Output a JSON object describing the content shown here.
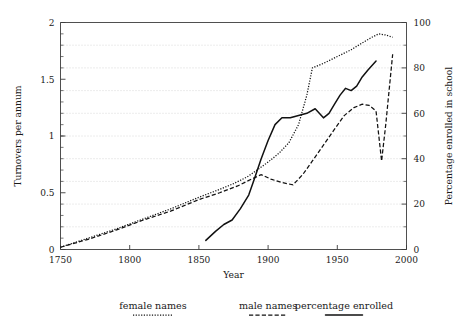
{
  "chart_data": {
    "type": "line",
    "title": "",
    "xlabel": "Year",
    "ylabel": "Turnovers per annum",
    "y2label": "Percentage enrolled in school",
    "xlim": [
      1750,
      2000
    ],
    "ylim": [
      0,
      2
    ],
    "y2lim": [
      0,
      100
    ],
    "xticks": [
      1750,
      1800,
      1850,
      1900,
      1950,
      2000
    ],
    "xticklabels": [
      "1750",
      "1800",
      "1850",
      "1900",
      "1950",
      "2000"
    ],
    "yticks": [
      0,
      0.5,
      1,
      1.5,
      2
    ],
    "yticklabels": [
      "0",
      "0.5",
      "1",
      "1.5",
      "2"
    ],
    "y2ticks": [
      0,
      20,
      40,
      60,
      80,
      100
    ],
    "y2ticklabels": [
      "0",
      "20",
      "40",
      "60",
      "80",
      "100"
    ],
    "grid": true,
    "grid_axis": "y2",
    "grid_values": [
      10,
      20,
      30,
      40,
      50,
      60,
      70,
      80,
      90
    ],
    "legend_position": "below",
    "series": [
      {
        "name": "female names",
        "axis": "left",
        "style": "dotted",
        "x": [
          1750,
          1770,
          1790,
          1810,
          1830,
          1850,
          1865,
          1875,
          1885,
          1892,
          1900,
          1908,
          1915,
          1922,
          1928,
          1932,
          1940,
          1950,
          1960,
          1968,
          1975,
          1980,
          1985,
          1990
        ],
        "values": [
          0.02,
          0.1,
          0.18,
          0.27,
          0.36,
          0.46,
          0.53,
          0.58,
          0.64,
          0.7,
          0.77,
          0.85,
          0.94,
          1.1,
          1.36,
          1.6,
          1.64,
          1.7,
          1.76,
          1.82,
          1.87,
          1.9,
          1.89,
          1.87
        ]
      },
      {
        "name": "male names",
        "axis": "left",
        "style": "dashed",
        "x": [
          1750,
          1770,
          1790,
          1810,
          1830,
          1850,
          1865,
          1878,
          1888,
          1895,
          1902,
          1910,
          1918,
          1925,
          1932,
          1940,
          1948,
          1955,
          1962,
          1968,
          1973,
          1978,
          1982,
          1985,
          1990
        ],
        "values": [
          0.02,
          0.09,
          0.17,
          0.26,
          0.34,
          0.44,
          0.5,
          0.56,
          0.62,
          0.66,
          0.62,
          0.59,
          0.57,
          0.66,
          0.78,
          0.92,
          1.06,
          1.18,
          1.25,
          1.28,
          1.27,
          1.22,
          0.78,
          1.1,
          1.72
        ]
      },
      {
        "name": "percentage enrolled",
        "axis": "right",
        "style": "solid",
        "x": [
          1855,
          1862,
          1868,
          1874,
          1880,
          1886,
          1890,
          1895,
          1900,
          1905,
          1910,
          1916,
          1922,
          1928,
          1934,
          1940,
          1944,
          1948,
          1952,
          1956,
          1960,
          1964,
          1968,
          1972,
          1978
        ],
        "values": [
          4,
          8,
          11,
          13,
          18,
          24,
          31,
          40,
          48,
          55,
          58,
          58,
          59,
          60,
          62,
          58,
          60,
          64,
          68,
          71,
          70,
          72,
          76,
          79,
          83
        ]
      }
    ],
    "legend": [
      {
        "label": "female names",
        "style": "dotted"
      },
      {
        "label": "male names",
        "style": "dashed"
      },
      {
        "label": "percentage enrolled",
        "style": "solid"
      }
    ]
  }
}
